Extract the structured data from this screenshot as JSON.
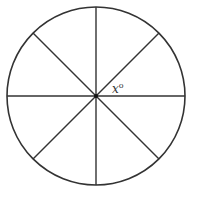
{
  "diagram": {
    "type": "circle divided into 8 equal sectors",
    "center": [
      96,
      96
    ],
    "radius": 89,
    "stroke_color": "#333333",
    "background": "#ffffff",
    "lines": [
      {
        "name": "vertical-diameter",
        "angle_deg": 90
      },
      {
        "name": "horizontal-diameter",
        "angle_deg": 0
      },
      {
        "name": "diagonal-45",
        "angle_deg": 45
      },
      {
        "name": "diagonal-135",
        "angle_deg": 135
      }
    ],
    "sector_count": 8,
    "angle_label": {
      "text": "x°",
      "base": "x",
      "degree": "o",
      "position": "between horizontal radius and upper-right diagonal"
    }
  }
}
